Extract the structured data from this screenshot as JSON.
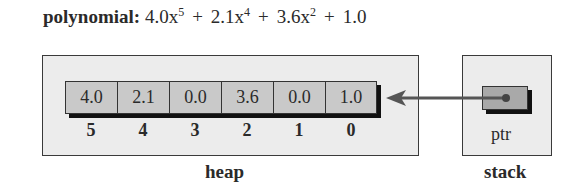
{
  "title": {
    "label": "polynomial:",
    "terms": [
      {
        "coef": "4.0",
        "var": "x",
        "exp": "5"
      },
      {
        "coef": "2.1",
        "var": "x",
        "exp": "4"
      },
      {
        "coef": "3.6",
        "var": "x",
        "exp": "2"
      },
      {
        "coef": "1.0",
        "var": "",
        "exp": ""
      }
    ],
    "operator": "+"
  },
  "heap": {
    "label": "heap",
    "array": {
      "values": [
        "4.0",
        "2.1",
        "0.0",
        "3.6",
        "0.0",
        "1.0"
      ],
      "indices": [
        "5",
        "4",
        "3",
        "2",
        "1",
        "0"
      ]
    }
  },
  "stack": {
    "label": "stack",
    "pointer": {
      "label": "ptr"
    }
  },
  "colors": {
    "region_fill": "#ececec",
    "cell_fill": "#c9c9c9",
    "pointer_fill": "#a9a9a9",
    "arrow": "#555555",
    "shadow": "#111111"
  }
}
